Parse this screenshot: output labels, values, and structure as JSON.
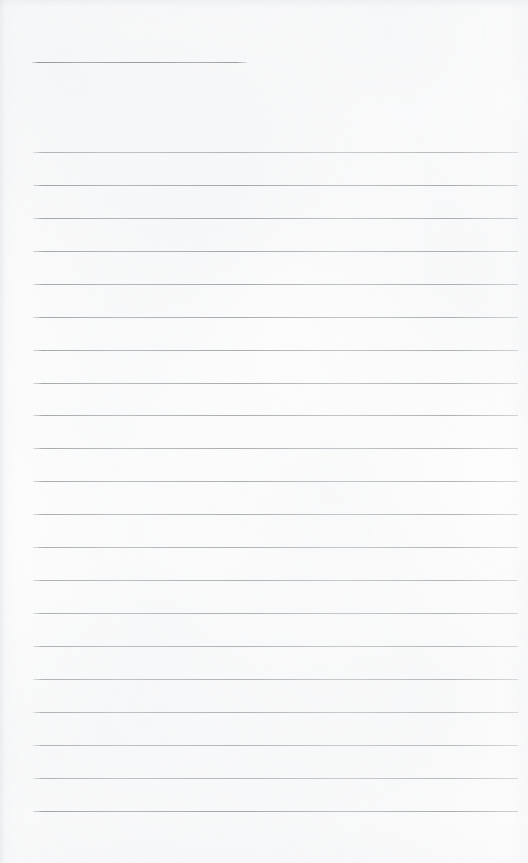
{
  "document": {
    "kind": "scanned-lined-notepaper",
    "page_width": 528,
    "page_height": 863,
    "background_color": "#fdfdfd",
    "rule_color": "#b5b8bd",
    "text_content": "",
    "handwriting_present": "none",
    "note": "Blank ruled sheet — no text, no headings, no marks"
  },
  "title_rule": {
    "label": "title-rule",
    "x": 32,
    "y": 62,
    "width": 215,
    "thickness": 1
  },
  "body_rules": {
    "label": "body-rules",
    "count": 21,
    "x": 33,
    "width": 485,
    "start_y": 152,
    "spacing": 33,
    "thickness": 1,
    "y_positions": [
      152,
      185,
      218,
      251,
      284,
      317,
      350,
      383,
      415,
      448,
      481,
      514,
      547,
      580,
      613,
      646,
      679,
      712,
      745,
      778,
      811
    ]
  },
  "margins": {
    "top_blank_height": 45,
    "bottom_blank_start": 815,
    "left_margin": 32,
    "right_margin": 10
  }
}
